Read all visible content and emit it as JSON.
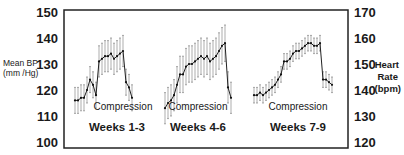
{
  "chart_data": {
    "type": "line",
    "title": "",
    "left_axis": {
      "label_line1": "Mean BP",
      "label_line2": "(mm /Hg)",
      "ticks": [
        150,
        140,
        130,
        120,
        110,
        100
      ],
      "ylim": [
        100,
        150
      ]
    },
    "right_axis": {
      "label_line1": "Heart",
      "label_line2": "Rate",
      "label_line3": "(bpm)",
      "ticks": [
        170,
        160,
        150,
        140,
        130,
        120
      ],
      "ylim": [
        120,
        170
      ]
    },
    "grid": false,
    "error_bars": true,
    "series": [
      {
        "name": "Weeks 1-3",
        "annotation": "Compression",
        "label": "Weeks 1-3",
        "x": [
          75,
          78,
          81,
          84,
          87,
          90,
          93,
          96,
          99,
          102,
          105,
          108,
          111,
          114,
          117,
          120,
          123,
          126,
          129,
          132
        ],
        "values": [
          116,
          116,
          117,
          117,
          120,
          124,
          122,
          118,
          131,
          132,
          133,
          133,
          134,
          132,
          133,
          134,
          135,
          123,
          121,
          117
        ],
        "err": [
          5,
          5,
          5,
          5,
          5,
          5,
          5,
          5,
          6,
          6,
          6,
          6,
          6,
          6,
          6,
          6,
          6,
          5,
          5,
          5
        ]
      },
      {
        "name": "Weeks 4-6",
        "annotation": "Compression",
        "label": "Weeks 4-6",
        "x": [
          165,
          168,
          171,
          174,
          177,
          180,
          183,
          186,
          189,
          192,
          195,
          198,
          201,
          204,
          207,
          210,
          213,
          216,
          219,
          222,
          225,
          228,
          231
        ],
        "values": [
          113,
          115,
          116,
          118,
          122,
          126,
          126,
          129,
          130,
          130,
          131,
          132,
          133,
          132,
          133,
          131,
          132,
          133,
          135,
          137,
          138,
          121,
          117
        ],
        "err": [
          6,
          6,
          6,
          6,
          7,
          7,
          7,
          7,
          7,
          7,
          7,
          7,
          7,
          7,
          7,
          7,
          7,
          7,
          7,
          7,
          7,
          6,
          6
        ]
      },
      {
        "name": "Weeks 7-9",
        "annotation": "Compression",
        "label": "Weeks 7-9",
        "x": [
          254,
          257,
          260,
          263,
          266,
          269,
          272,
          275,
          278,
          281,
          284,
          287,
          290,
          293,
          296,
          299,
          302,
          305,
          308,
          311,
          314,
          317,
          320,
          323,
          326,
          329,
          332
        ],
        "values": [
          118,
          118,
          119,
          118,
          119,
          120,
          121,
          122,
          124,
          126,
          131,
          131,
          132,
          134,
          135,
          135,
          136,
          137,
          138,
          138,
          137,
          137,
          138,
          124,
          124,
          123,
          122
        ],
        "err": [
          3,
          3,
          3,
          3,
          3,
          3,
          3,
          3,
          3,
          3,
          3,
          3,
          3,
          3,
          3,
          3,
          3,
          3,
          3,
          3,
          3,
          3,
          3,
          3,
          3,
          3,
          3
        ]
      }
    ]
  }
}
